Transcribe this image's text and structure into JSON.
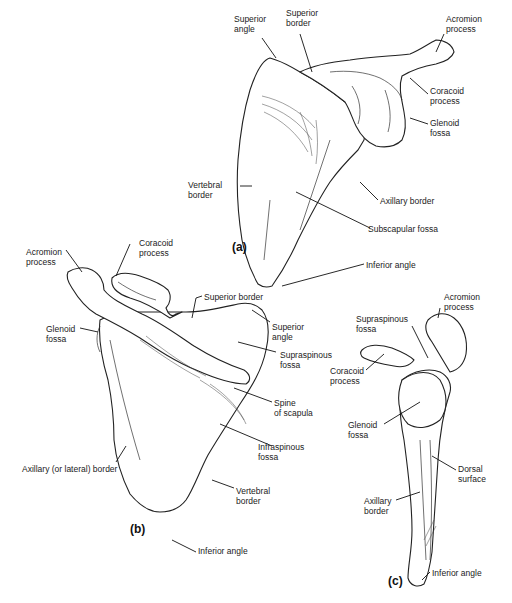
{
  "figure": {
    "subject": "Scapula",
    "views": [
      {
        "id": "a",
        "tag": "(a)",
        "labels": {
          "superior_angle": [
            "Superior",
            "angle"
          ],
          "superior_border": [
            "Superior",
            "border"
          ],
          "acromion_process": [
            "Acromion",
            "process"
          ],
          "coracoid_process": [
            "Coracoid",
            "process"
          ],
          "glenoid_fossa": [
            "Glenoid",
            "fossa"
          ],
          "vertebral_border": [
            "Vertebral",
            "border"
          ],
          "axillary_border": [
            "Axillary border"
          ],
          "subscapular_fossa": [
            "Subscapular fossa"
          ],
          "inferior_angle": [
            "Inferior angle"
          ]
        }
      },
      {
        "id": "b",
        "tag": "(b)",
        "labels": {
          "acromion_process": [
            "Acromion",
            "process"
          ],
          "coracoid_process": [
            "Coracoid",
            "process"
          ],
          "glenoid_fossa": [
            "Glenoid",
            "fossa"
          ],
          "superior_border": [
            "Superior border"
          ],
          "superior_angle": [
            "Superior",
            "angle"
          ],
          "supraspinous_fossa": [
            "Supraspinous",
            "fossa"
          ],
          "spine_of_scapula": [
            "Spine",
            "of scapula"
          ],
          "infraspinous_fossa": [
            "Infraspinous",
            "fossa"
          ],
          "axillary_border": [
            "Axillary (or lateral) border"
          ],
          "vertebral_border": [
            "Vertebral",
            "border"
          ],
          "inferior_angle": [
            "Inferior angle"
          ]
        }
      },
      {
        "id": "c",
        "tag": "(c)",
        "labels": {
          "acromion_process": [
            "Acromion",
            "process"
          ],
          "supraspinous_fossa": [
            "Supraspinous",
            "fossa"
          ],
          "coracoid_process": [
            "Coracoid",
            "process"
          ],
          "glenoid_fossa": [
            "Glenoid",
            "fossa"
          ],
          "dorsal_surface": [
            "Dorsal",
            "surface"
          ],
          "axillary_border": [
            "Axillary",
            "border"
          ],
          "inferior_angle": [
            "Inferior angle"
          ]
        }
      }
    ]
  }
}
